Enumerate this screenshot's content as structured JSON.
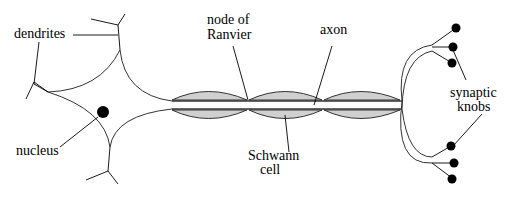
{
  "diagram": {
    "type": "neuron-anatomy",
    "labels": {
      "dendrites": "dendrites",
      "nucleus": "nucleus",
      "node_of_ranvier_line1": "node of",
      "node_of_ranvier_line2": "Ranvier",
      "axon": "axon",
      "schwann_line1": "Schwann",
      "schwann_line2": "cell",
      "synaptic_line1": "synaptic",
      "synaptic_line2": "knobs"
    },
    "colors": {
      "sheath_fill": "#d0d0d0",
      "outline": "#333333",
      "nucleus": "#000000"
    },
    "components": [
      "dendrites",
      "nucleus",
      "cell body",
      "axon",
      "node of Ranvier",
      "Schwann cell",
      "synaptic knobs"
    ]
  }
}
